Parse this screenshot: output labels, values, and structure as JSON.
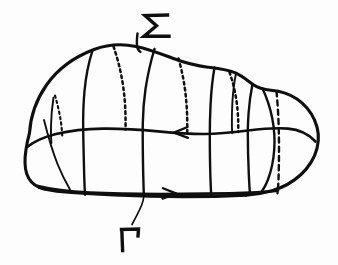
{
  "figure": {
    "background_color": "#fdfdfd",
    "ink_color": "#100f0f",
    "width": 338,
    "height": 265
  },
  "labels": {
    "sigma": {
      "text": "Σ",
      "name": "sigma-label",
      "meaning": "surface-sigma",
      "x": 142,
      "y": 12,
      "font_size": 26
    },
    "gamma": {
      "text": "Γ",
      "name": "gamma-label",
      "meaning": "boundary-curve-gamma",
      "x": 120,
      "y": 224,
      "font_size": 26
    }
  },
  "annotations": {
    "sigma_leader": "short vertical tick from sigma label down to the upper outline",
    "gamma_leader": "short diagonal leader from gamma label up to the lower boundary curve",
    "middle_arrow_direction": "left",
    "bottom_arrow_direction": "right"
  },
  "curves": {
    "upper_outline": "blob top edge rising from left to a peak then descending right",
    "lower_outline": "blob bottom edge, nearly flat, rounded at both ends",
    "equator": "middle horizontal curve with leftward arrow",
    "boundary": "bottom curve with rightward arrow",
    "meridians_solid_count": 7,
    "meridians_hidden_count": 5
  }
}
